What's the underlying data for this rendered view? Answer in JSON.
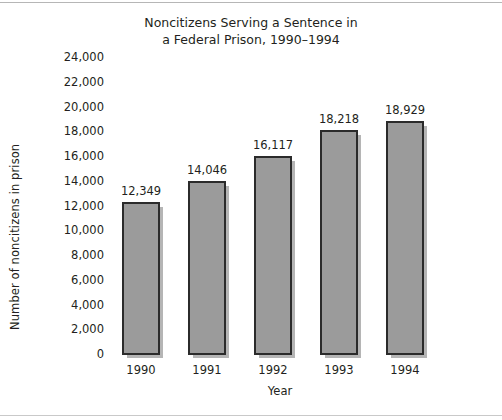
{
  "chart_data": {
    "type": "bar",
    "title": "Noncitizens Serving a Sentence in\na Federal Prison, 1990–1994",
    "xlabel": "Year",
    "ylabel": "Number of noncitizens in prison",
    "categories": [
      "1990",
      "1991",
      "1992",
      "1993",
      "1994"
    ],
    "values": [
      12349,
      14046,
      16117,
      18218,
      18929
    ],
    "value_labels": [
      "12,349",
      "14,046",
      "16,117",
      "18,218",
      "18,929"
    ],
    "ylim": [
      0,
      24000
    ],
    "ytick_values": [
      24000,
      22000,
      20000,
      18000,
      16000,
      14000,
      12000,
      10000,
      8000,
      6000,
      4000,
      2000,
      0
    ],
    "ytick_labels": [
      "24,000",
      "22,000",
      "20,000",
      "18,000",
      "16,000",
      "14,000",
      "12,000",
      "10,000",
      "8,000",
      "6,000",
      "4,000",
      "2,000",
      "0"
    ],
    "grid": false,
    "legend": false,
    "bar_fill_color": "#9b9b9b",
    "bar_edge_color": "#2b2b2b",
    "text_color": "#231f20",
    "background_color": "#ffffff"
  }
}
